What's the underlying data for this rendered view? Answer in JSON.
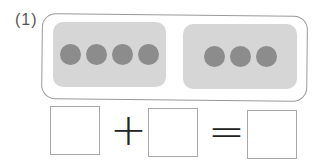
{
  "problem": {
    "number_label": "(1)",
    "groups": [
      {
        "count": 4,
        "color": "#8c8c8c"
      },
      {
        "count": 3,
        "color": "#8c8c8c"
      }
    ],
    "equation": {
      "operand1": "",
      "operator1": "+",
      "operand2": "",
      "operator2": "=",
      "result": ""
    }
  }
}
